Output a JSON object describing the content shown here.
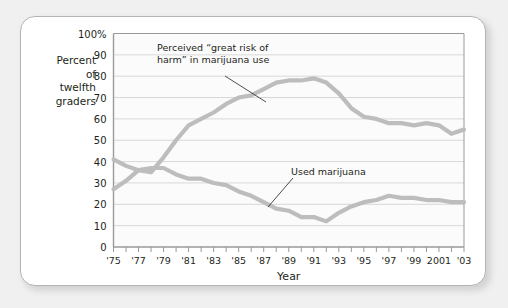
{
  "figure": {
    "background_color": "#f0f0f0",
    "card_color": "#ffffff",
    "border_color": "#b4b4b4"
  },
  "y_axis_caption": {
    "line1": "Percent",
    "line2": "of",
    "line3": "twelfth",
    "line4": "graders"
  },
  "annotations": {
    "risk_line1": "Perceived “great risk of",
    "risk_line2": "harm” in marijuana use",
    "use_label": "Used marijuana"
  },
  "chart_data": {
    "type": "line",
    "title": "",
    "subtitle": "",
    "xlabel": "Year",
    "ylabel": "Percent of twelfth graders",
    "ylim": [
      0,
      100
    ],
    "xlim": [
      1975,
      2003
    ],
    "grid": true,
    "legend_position": "inline-annotation",
    "series_color": "#bdbdbd",
    "gridline_color": "#d8d8d8",
    "plot_border_color": "#9a9a9a",
    "ytick_labels": [
      "0",
      "10",
      "20",
      "30",
      "40",
      "50",
      "60",
      "70",
      "80",
      "90",
      "100%"
    ],
    "ytick_values": [
      0,
      10,
      20,
      30,
      40,
      50,
      60,
      70,
      80,
      90,
      100
    ],
    "xtick_labels": [
      "'75",
      "'77",
      "'79",
      "'81",
      "'83",
      "'85",
      "'87",
      "'89",
      "'91",
      "'93",
      "'95",
      "'97",
      "'99",
      "2001",
      "'03"
    ],
    "xtick_values": [
      1975,
      1977,
      1979,
      1981,
      1983,
      1985,
      1987,
      1989,
      1991,
      1993,
      1995,
      1997,
      1999,
      2001,
      2003
    ],
    "x": [
      1975,
      1976,
      1977,
      1978,
      1979,
      1980,
      1981,
      1982,
      1983,
      1984,
      1985,
      1986,
      1987,
      1988,
      1989,
      1990,
      1991,
      1992,
      1993,
      1994,
      1995,
      1996,
      1997,
      1998,
      1999,
      2000,
      2001,
      2002,
      2003
    ],
    "series": [
      {
        "name": "Perceived “great risk of harm” in marijuana use",
        "values": [
          27,
          31,
          36,
          35,
          42,
          50,
          57,
          60,
          63,
          67,
          70,
          71,
          74,
          77,
          78,
          78,
          79,
          77,
          72,
          65,
          61,
          60,
          58,
          58,
          57,
          58,
          57,
          53,
          55
        ]
      },
      {
        "name": "Used marijuana",
        "values": [
          41,
          38,
          36,
          37,
          37,
          34,
          32,
          32,
          30,
          29,
          26,
          24,
          21,
          18,
          17,
          14,
          14,
          12,
          16,
          19,
          21,
          22,
          24,
          23,
          23,
          22,
          22,
          21,
          21
        ]
      }
    ]
  }
}
